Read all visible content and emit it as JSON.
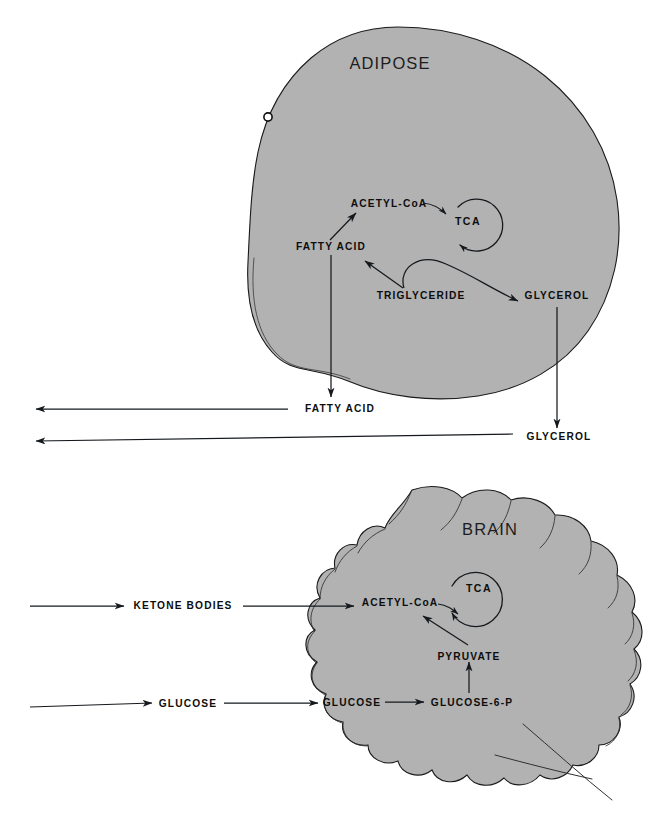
{
  "figure": {
    "background_color": "#ffffff",
    "tissue_fill_color": "#b2b2b2",
    "outline_color": "#1a1a1a",
    "arrow_color": "#15191d"
  },
  "panels": [
    {
      "id": "adipose",
      "title": "ADIPOSE",
      "cycle_label": "TCA",
      "internal_labels": [
        {
          "id": "acetyl-coa",
          "text": "ACETYL-CoA"
        },
        {
          "id": "fatty-acid",
          "text": "FATTY  ACID"
        },
        {
          "id": "triglyceride",
          "text": "TRIGLYCERIDE"
        },
        {
          "id": "glycerol",
          "text": "GLYCEROL"
        }
      ],
      "external_labels": [
        {
          "id": "fatty-acid-out",
          "text": "FATTY ACID"
        },
        {
          "id": "glycerol-out",
          "text": "GLYCEROL"
        }
      ],
      "reactions": [
        {
          "from": "FATTY  ACID",
          "to": "ACETYL-CoA",
          "direction": "forward"
        },
        {
          "from": "ACETYL-CoA",
          "to": "TCA",
          "direction": "forward"
        },
        {
          "from": "TRIGLYCERIDE",
          "to": "FATTY  ACID",
          "direction": "forward"
        },
        {
          "from": "TRIGLYCERIDE",
          "to": "GLYCEROL",
          "direction": "forward"
        },
        {
          "from": "FATTY  ACID",
          "to": "FATTY ACID",
          "direction": "export"
        },
        {
          "from": "GLYCEROL",
          "to": "GLYCEROL",
          "direction": "export"
        },
        {
          "from": "FATTY ACID",
          "to": "bloodstream",
          "direction": "left"
        },
        {
          "from": "GLYCEROL",
          "to": "bloodstream",
          "direction": "left"
        }
      ]
    },
    {
      "id": "brain",
      "title": "BRAIN",
      "cycle_label": "TCA",
      "internal_labels": [
        {
          "id": "acetyl-coa",
          "text": "ACETYL-CoA"
        },
        {
          "id": "pyruvate",
          "text": "PYRUVATE"
        },
        {
          "id": "glucose-in",
          "text": "GLUCOSE"
        },
        {
          "id": "glucose-6-p",
          "text": "GLUCOSE-6-P"
        }
      ],
      "external_labels": [
        {
          "id": "ketone-bodies-in",
          "text": "KETONE BODIES"
        },
        {
          "id": "glucose-in-ext",
          "text": "GLUCOSE"
        }
      ],
      "reactions": [
        {
          "from": "bloodstream",
          "to": "KETONE BODIES",
          "direction": "right"
        },
        {
          "from": "KETONE BODIES",
          "to": "ACETYL-CoA",
          "direction": "forward"
        },
        {
          "from": "ACETYL-CoA",
          "to": "TCA",
          "direction": "forward"
        },
        {
          "from": "PYRUVATE",
          "to": "ACETYL-CoA",
          "direction": "forward"
        },
        {
          "from": "GLUCOSE-6-P",
          "to": "PYRUVATE",
          "direction": "forward"
        },
        {
          "from": "bloodstream",
          "to": "GLUCOSE",
          "direction": "right"
        },
        {
          "from": "GLUCOSE",
          "to": "GLUCOSE",
          "direction": "uptake"
        },
        {
          "from": "GLUCOSE",
          "to": "GLUCOSE-6-P",
          "direction": "forward"
        }
      ]
    }
  ]
}
